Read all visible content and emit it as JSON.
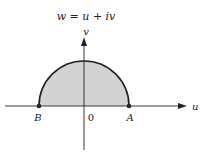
{
  "title": "w = u + iv",
  "axes": {
    "horizontal_label": "u",
    "vertical_label": "v",
    "origin_label": "0"
  },
  "points": [
    {
      "label": "B",
      "x": 39,
      "y": 106
    },
    {
      "label": "A",
      "x": 129,
      "y": 106
    }
  ],
  "region": {
    "shape": "upper half-disk",
    "fill": "#d3d3d3",
    "stroke": "#222222"
  },
  "colors": {
    "axis": "#222222",
    "fill": "#d3d3d3"
  }
}
